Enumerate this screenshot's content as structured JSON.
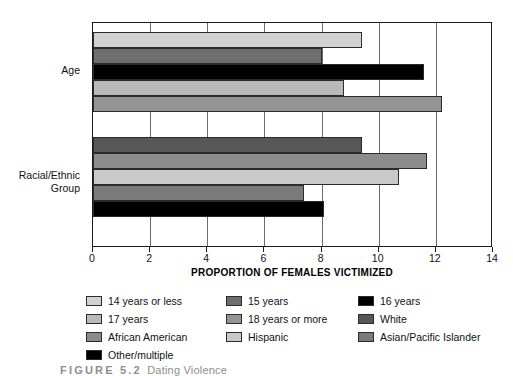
{
  "chart_data": {
    "type": "bar",
    "orientation": "horizontal",
    "title": "",
    "xlabel": "PROPORTION OF FEMALES VICTIMIZED",
    "ylabel": "",
    "xlim": [
      0,
      14
    ],
    "xticks": [
      0,
      2,
      4,
      6,
      8,
      10,
      12,
      14
    ],
    "xtick_labels": [
      "0",
      "2",
      "4",
      "6",
      "8",
      "10",
      "12",
      "14"
    ],
    "grid": "vertical",
    "legend_position": "below",
    "categories": [
      "Age",
      "Racial/Ethnic\nGroup"
    ],
    "groups": [
      {
        "name": "Age",
        "label": "Age",
        "bars": [
          {
            "name": "14 years or less",
            "value": 9.4,
            "color": "#d2d2d2"
          },
          {
            "name": "15 years",
            "value": 8.0,
            "color": "#6e6e6e"
          },
          {
            "name": "16 years",
            "value": 11.6,
            "color": "#000000"
          },
          {
            "name": "17 years",
            "value": 8.8,
            "color": "#b9b9b9"
          },
          {
            "name": "18 years or more",
            "value": 12.2,
            "color": "#949494"
          }
        ]
      },
      {
        "name": "Racial/Ethnic Group",
        "label": "Racial/Ethnic\nGroup",
        "bars": [
          {
            "name": "White",
            "value": 9.4,
            "color": "#575757"
          },
          {
            "name": "African American",
            "value": 11.7,
            "color": "#8c8c8c"
          },
          {
            "name": "Hispanic",
            "value": 10.7,
            "color": "#c9c9c9"
          },
          {
            "name": "Asian/Pacific Islander",
            "value": 7.4,
            "color": "#7a7a7a"
          },
          {
            "name": "Other/multiple",
            "value": 8.1,
            "color": "#000000"
          }
        ]
      }
    ],
    "series": [
      {
        "name": "14 years or less",
        "value": 9.4
      },
      {
        "name": "15 years",
        "value": 8.0
      },
      {
        "name": "16 years",
        "value": 11.6
      },
      {
        "name": "17 years",
        "value": 8.8
      },
      {
        "name": "18 years or more",
        "value": 12.2
      },
      {
        "name": "White",
        "value": 9.4
      },
      {
        "name": "African American",
        "value": 11.7
      },
      {
        "name": "Hispanic",
        "value": 10.7
      },
      {
        "name": "Asian/Pacific Islander",
        "value": 7.4
      },
      {
        "name": "Other/multiple",
        "value": 8.1
      }
    ]
  },
  "legend": {
    "rows": [
      [
        {
          "label": "14 years or less",
          "color": "#d2d2d2"
        },
        {
          "label": "15 years",
          "color": "#6e6e6e"
        },
        {
          "label": "16 years",
          "color": "#000000"
        }
      ],
      [
        {
          "label": "17 years",
          "color": "#b9b9b9"
        },
        {
          "label": "18 years or more",
          "color": "#949494"
        },
        {
          "label": "White",
          "color": "#575757"
        }
      ],
      [
        {
          "label": "African American",
          "color": "#8c8c8c"
        },
        {
          "label": "Hispanic",
          "color": "#c9c9c9"
        },
        {
          "label": "Asian/Pacific Islander",
          "color": "#7a7a7a"
        }
      ],
      [
        {
          "label": "Other/multiple",
          "color": "#000000"
        }
      ]
    ]
  },
  "caption": {
    "prefix": "FIGURE",
    "number": "5.2",
    "text": "Dating Violence"
  },
  "colors": {
    "axis": "#1a1a1a",
    "gridline": "#6b6b6b",
    "bar_outline": "#2b2b2b",
    "background": "#ffffff"
  }
}
